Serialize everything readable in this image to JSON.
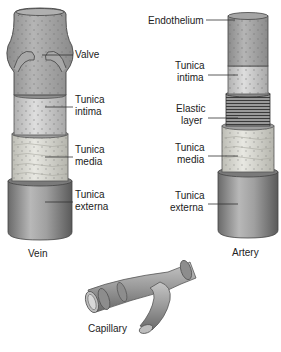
{
  "diagram": {
    "vein": {
      "caption": "Vein",
      "labels": {
        "valve": "Valve",
        "tunica_intima": [
          "Tunica",
          "intima"
        ],
        "tunica_media": [
          "Tunica",
          "media"
        ],
        "tunica_externa": [
          "Tunica",
          "externa"
        ]
      }
    },
    "artery": {
      "caption": "Artery",
      "labels": {
        "endothelium": "Endothelium",
        "tunica_intima": [
          "Tunica",
          "intima"
        ],
        "elastic_layer": [
          "Elastic",
          "layer"
        ],
        "tunica_media": [
          "Tunica",
          "media"
        ],
        "tunica_externa": [
          "Tunica",
          "externa"
        ]
      }
    },
    "capillary": {
      "caption": "Capillary"
    },
    "colors": {
      "endothelium": "#9a9a9a",
      "intima": "#cfcfcf",
      "media": "#dcdcd4",
      "externa": "#8c8c8c",
      "outline": "#444444"
    }
  }
}
